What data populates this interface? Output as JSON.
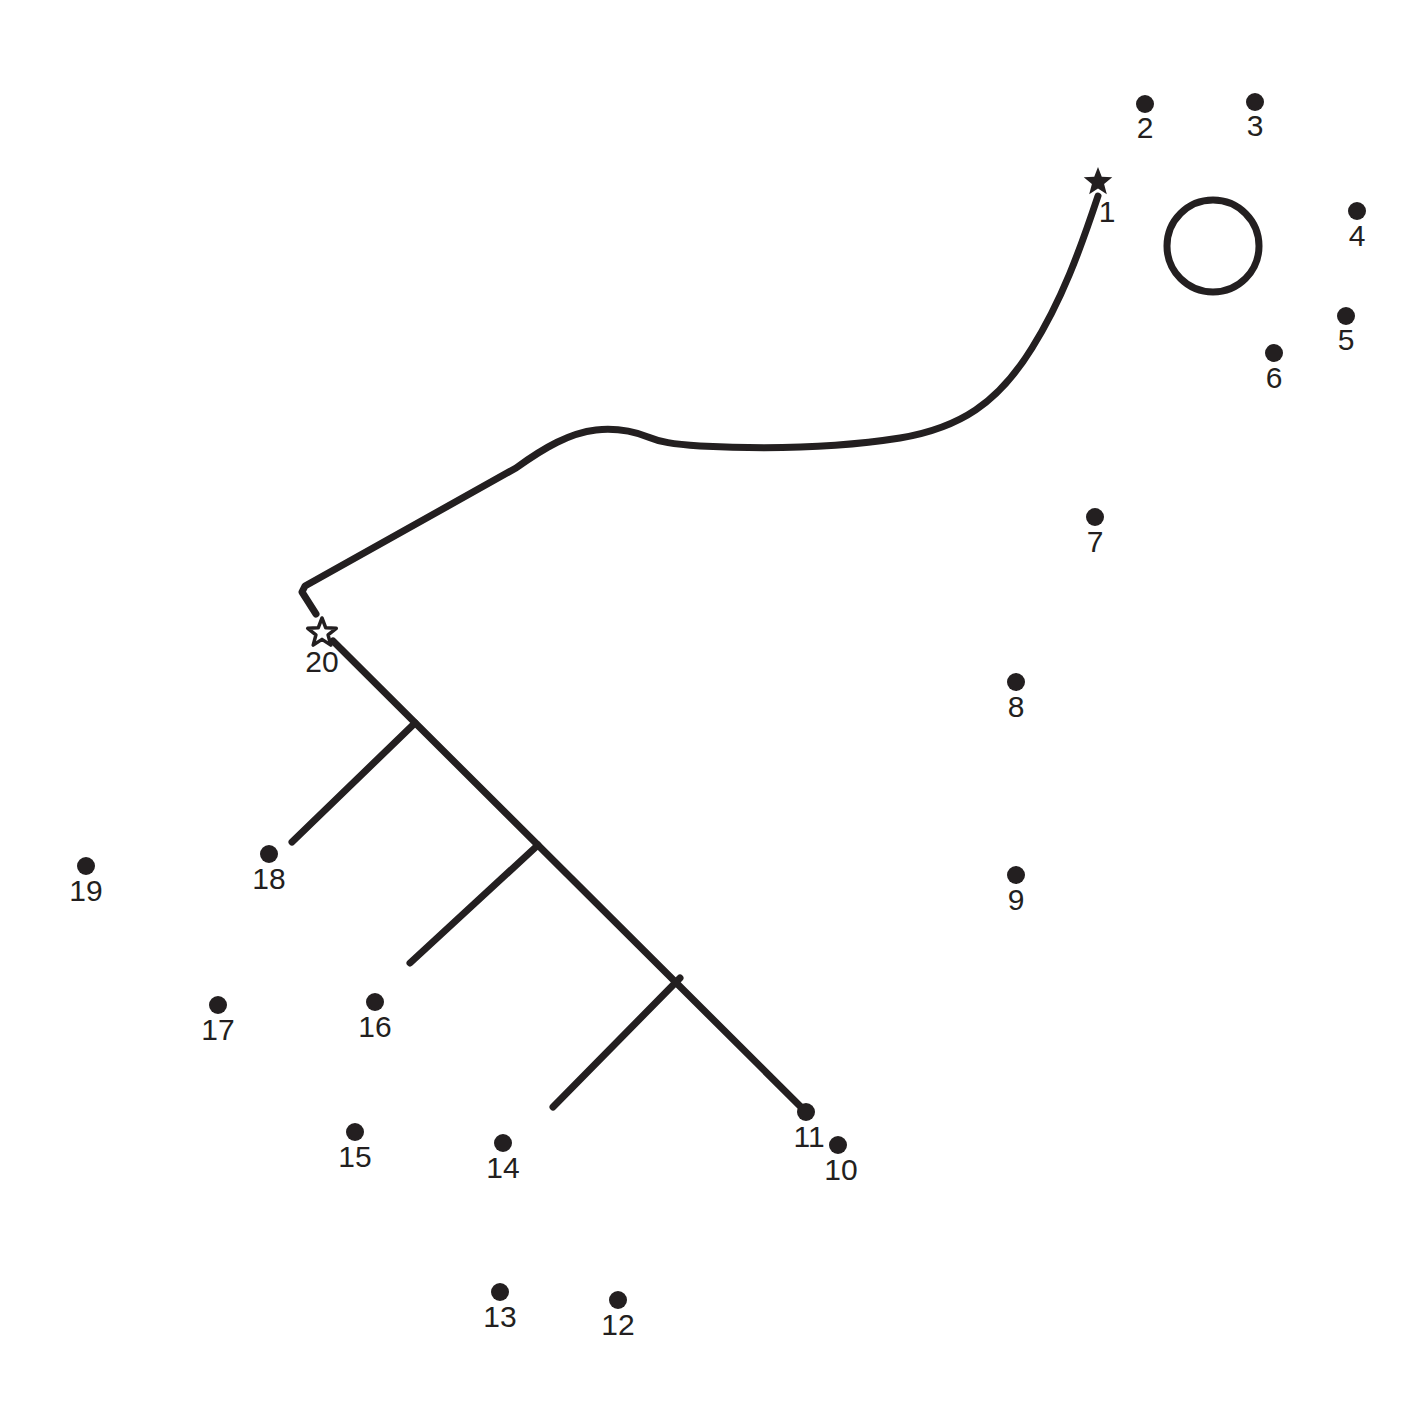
{
  "page": {
    "background_color": "#ffffff",
    "ink_color": "#231f20",
    "width": 1407,
    "height": 1422
  },
  "puzzle": {
    "type": "connect-the-dots",
    "dot_count": 20,
    "start_marker": "filled-star",
    "end_marker": "open-star",
    "dots": [
      {
        "number": "1",
        "x": 1098,
        "y": 182,
        "marker": "filled-star",
        "label_x": 1107,
        "label_y": 222
      },
      {
        "number": "2",
        "x": 1145,
        "y": 104,
        "marker": "dot",
        "label_x": 1145,
        "label_y": 138
      },
      {
        "number": "3",
        "x": 1255,
        "y": 102,
        "marker": "dot",
        "label_x": 1255,
        "label_y": 136
      },
      {
        "number": "4",
        "x": 1357,
        "y": 211,
        "marker": "dot",
        "label_x": 1357,
        "label_y": 246
      },
      {
        "number": "5",
        "x": 1346,
        "y": 316,
        "marker": "dot",
        "label_x": 1346,
        "label_y": 350
      },
      {
        "number": "6",
        "x": 1274,
        "y": 353,
        "marker": "dot",
        "label_x": 1274,
        "label_y": 388
      },
      {
        "number": "7",
        "x": 1095,
        "y": 517,
        "marker": "dot",
        "label_x": 1095,
        "label_y": 552
      },
      {
        "number": "8",
        "x": 1016,
        "y": 682,
        "marker": "dot",
        "label_x": 1016,
        "label_y": 717
      },
      {
        "number": "9",
        "x": 1016,
        "y": 875,
        "marker": "dot",
        "label_x": 1016,
        "label_y": 910
      },
      {
        "number": "10",
        "x": 838,
        "y": 1145,
        "marker": "dot",
        "label_x": 841,
        "label_y": 1180
      },
      {
        "number": "11",
        "x": 806,
        "y": 1112,
        "marker": "dot",
        "label_x": 809,
        "label_y": 1147
      },
      {
        "number": "12",
        "x": 618,
        "y": 1300,
        "marker": "dot",
        "label_x": 618,
        "label_y": 1335
      },
      {
        "number": "13",
        "x": 500,
        "y": 1292,
        "marker": "dot",
        "label_x": 500,
        "label_y": 1327
      },
      {
        "number": "14",
        "x": 503,
        "y": 1143,
        "marker": "dot",
        "label_x": 503,
        "label_y": 1178
      },
      {
        "number": "15",
        "x": 355,
        "y": 1132,
        "marker": "dot",
        "label_x": 355,
        "label_y": 1167
      },
      {
        "number": "16",
        "x": 375,
        "y": 1002,
        "marker": "dot",
        "label_x": 375,
        "label_y": 1037
      },
      {
        "number": "17",
        "x": 218,
        "y": 1005,
        "marker": "dot",
        "label_x": 218,
        "label_y": 1040
      },
      {
        "number": "18",
        "x": 269,
        "y": 854,
        "marker": "dot",
        "label_x": 269,
        "label_y": 889
      },
      {
        "number": "19",
        "x": 86,
        "y": 866,
        "marker": "dot",
        "label_x": 86,
        "label_y": 901
      },
      {
        "number": "20",
        "x": 322,
        "y": 633,
        "marker": "open-star",
        "label_x": 322,
        "label_y": 672
      }
    ],
    "dot_radius": 9,
    "strokes": [
      {
        "name": "main-curve",
        "d": "M 1098 196 C 1080 250 1062 300 1032 348 C 998 403 960 428 900 438 C 830 449 760 449 700 446 C 672 444 660 442 648 437 C 630 430 615 428 596 430 C 570 433 545 447 516 468 L 305 586 L 302 592 L 316 614"
      },
      {
        "name": "branch-trunk",
        "d": "M 333 641 L 806 1112"
      },
      {
        "name": "branch-upper",
        "d": "M 415 723 L 292 842"
      },
      {
        "name": "branch-middle",
        "d": "M 538 845 L 410 963"
      },
      {
        "name": "branch-lower",
        "d": "M 680 978 L 553 1107"
      }
    ],
    "open_circle": {
      "name": "open-circle-shape",
      "cx": 1213,
      "cy": 246,
      "r": 46
    }
  }
}
